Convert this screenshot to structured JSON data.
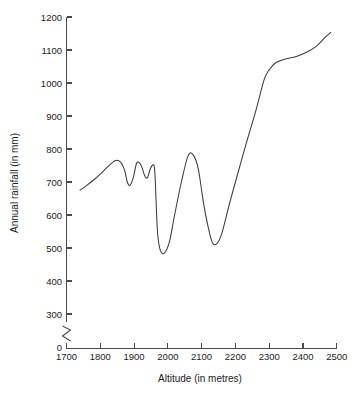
{
  "chart_data": {
    "type": "line",
    "title": "",
    "subtitle": "",
    "xlabel": "Altitude (in metres)",
    "ylabel": "Annual rainfall (in mm)",
    "xlim": [
      1700,
      2500
    ],
    "ylim": [
      0,
      1200
    ],
    "y_axis_break": true,
    "y_break_between": [
      0,
      300
    ],
    "grid": false,
    "legend": null,
    "x_ticks": [
      1700,
      1800,
      1900,
      2000,
      2100,
      2200,
      2300,
      2400,
      2500
    ],
    "x_tick_labels": [
      "1700",
      "1800",
      "1900",
      "2000",
      "2100",
      "2200",
      "2300",
      "2400",
      "2500"
    ],
    "y_ticks": [
      0,
      300,
      400,
      500,
      600,
      700,
      800,
      900,
      1000,
      1100,
      1200
    ],
    "y_tick_labels": [
      "0",
      "300",
      "400",
      "500",
      "600",
      "700",
      "800",
      "900",
      "1000",
      "1100",
      "1200"
    ],
    "series": [
      {
        "name": "Annual rainfall",
        "color": "#3b3b3b",
        "x": [
          1740,
          1760,
          1780,
          1800,
          1820,
          1845,
          1860,
          1872,
          1880,
          1888,
          1898,
          1908,
          1920,
          1932,
          1940,
          1948,
          1956,
          1960,
          1963,
          1966,
          1970,
          1978,
          1990,
          2005,
          2020,
          2040,
          2060,
          2075,
          2090,
          2105,
          2120,
          2132,
          2145,
          2160,
          2180,
          2200,
          2230,
          2260,
          2285,
          2300,
          2320,
          2345,
          2380,
          2410,
          2440,
          2465,
          2482
        ],
        "y": [
          675,
          690,
          706,
          724,
          744,
          765,
          760,
          735,
          700,
          690,
          715,
          758,
          752,
          718,
          714,
          740,
          752,
          745,
          700,
          620,
          540,
          492,
          485,
          520,
          600,
          700,
          780,
          782,
          740,
          640,
          560,
          516,
          513,
          545,
          625,
          700,
          810,
          915,
          1010,
          1040,
          1062,
          1072,
          1080,
          1093,
          1112,
          1138,
          1153
        ]
      }
    ]
  },
  "figure": {
    "background_color": "#ffffff",
    "axis_color": "#4a4a4a",
    "text_color": "#1a1a1a"
  }
}
